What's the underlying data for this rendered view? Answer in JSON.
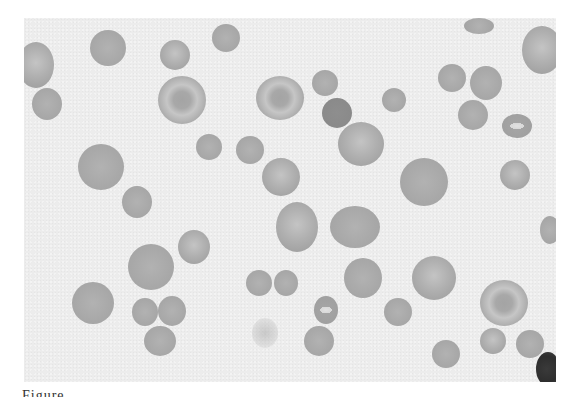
{
  "figure": {
    "type": "blood-smear-micrograph",
    "background_color": "#ececec",
    "cell_color": "#a9a9a9",
    "caption_fragment": "Figure"
  },
  "cells": [
    {
      "x": -6,
      "y": 24,
      "w": 36,
      "h": 46,
      "kind": "pale"
    },
    {
      "x": 8,
      "y": 70,
      "w": 30,
      "h": 32,
      "kind": "solid"
    },
    {
      "x": 66,
      "y": 12,
      "w": 36,
      "h": 36,
      "kind": "solid"
    },
    {
      "x": 136,
      "y": 22,
      "w": 30,
      "h": 30,
      "kind": "pale"
    },
    {
      "x": 188,
      "y": 6,
      "w": 28,
      "h": 28,
      "kind": "solid"
    },
    {
      "x": 134,
      "y": 58,
      "w": 48,
      "h": 48,
      "kind": "target"
    },
    {
      "x": 232,
      "y": 58,
      "w": 48,
      "h": 44,
      "kind": "target"
    },
    {
      "x": 288,
      "y": 52,
      "w": 26,
      "h": 26,
      "kind": "solid"
    },
    {
      "x": 298,
      "y": 80,
      "w": 30,
      "h": 30,
      "kind": "dark"
    },
    {
      "x": 358,
      "y": 70,
      "w": 24,
      "h": 24,
      "kind": "solid"
    },
    {
      "x": 314,
      "y": 104,
      "w": 46,
      "h": 44,
      "kind": "pale"
    },
    {
      "x": 440,
      "y": 0,
      "w": 30,
      "h": 16,
      "kind": "solid"
    },
    {
      "x": 498,
      "y": 8,
      "w": 40,
      "h": 48,
      "kind": "pale"
    },
    {
      "x": 414,
      "y": 46,
      "w": 28,
      "h": 28,
      "kind": "solid"
    },
    {
      "x": 446,
      "y": 48,
      "w": 32,
      "h": 34,
      "kind": "solid"
    },
    {
      "x": 434,
      "y": 82,
      "w": 30,
      "h": 30,
      "kind": "solid"
    },
    {
      "x": 478,
      "y": 96,
      "w": 30,
      "h": 24,
      "kind": "stomatocyte"
    },
    {
      "x": 172,
      "y": 116,
      "w": 26,
      "h": 26,
      "kind": "solid"
    },
    {
      "x": 212,
      "y": 118,
      "w": 28,
      "h": 28,
      "kind": "solid"
    },
    {
      "x": 54,
      "y": 126,
      "w": 46,
      "h": 46,
      "kind": "solid"
    },
    {
      "x": 238,
      "y": 140,
      "w": 38,
      "h": 38,
      "kind": "pale"
    },
    {
      "x": 376,
      "y": 140,
      "w": 48,
      "h": 48,
      "kind": "solid"
    },
    {
      "x": 476,
      "y": 142,
      "w": 30,
      "h": 30,
      "kind": "pale"
    },
    {
      "x": 98,
      "y": 168,
      "w": 30,
      "h": 32,
      "kind": "solid"
    },
    {
      "x": 252,
      "y": 184,
      "w": 42,
      "h": 50,
      "kind": "pale"
    },
    {
      "x": 306,
      "y": 188,
      "w": 50,
      "h": 42,
      "kind": "solid"
    },
    {
      "x": 516,
      "y": 198,
      "w": 20,
      "h": 28,
      "kind": "solid"
    },
    {
      "x": 154,
      "y": 212,
      "w": 32,
      "h": 34,
      "kind": "pale"
    },
    {
      "x": 104,
      "y": 226,
      "w": 46,
      "h": 46,
      "kind": "solid"
    },
    {
      "x": 320,
      "y": 240,
      "w": 38,
      "h": 40,
      "kind": "solid"
    },
    {
      "x": 388,
      "y": 238,
      "w": 44,
      "h": 44,
      "kind": "pale"
    },
    {
      "x": 222,
      "y": 252,
      "w": 26,
      "h": 26,
      "kind": "solid"
    },
    {
      "x": 250,
      "y": 252,
      "w": 24,
      "h": 26,
      "kind": "solid"
    },
    {
      "x": 48,
      "y": 264,
      "w": 42,
      "h": 42,
      "kind": "solid"
    },
    {
      "x": 456,
      "y": 262,
      "w": 48,
      "h": 46,
      "kind": "target"
    },
    {
      "x": 108,
      "y": 280,
      "w": 26,
      "h": 28,
      "kind": "solid"
    },
    {
      "x": 134,
      "y": 278,
      "w": 28,
      "h": 30,
      "kind": "solid"
    },
    {
      "x": 290,
      "y": 278,
      "w": 24,
      "h": 28,
      "kind": "stomatocyte"
    },
    {
      "x": 360,
      "y": 280,
      "w": 28,
      "h": 28,
      "kind": "solid"
    },
    {
      "x": 120,
      "y": 308,
      "w": 32,
      "h": 30,
      "kind": "solid"
    },
    {
      "x": 228,
      "y": 300,
      "w": 26,
      "h": 30,
      "kind": "ghost"
    },
    {
      "x": 280,
      "y": 308,
      "w": 30,
      "h": 30,
      "kind": "solid"
    },
    {
      "x": 456,
      "y": 310,
      "w": 26,
      "h": 26,
      "kind": "pale"
    },
    {
      "x": 492,
      "y": 312,
      "w": 28,
      "h": 28,
      "kind": "solid"
    },
    {
      "x": 408,
      "y": 322,
      "w": 28,
      "h": 28,
      "kind": "solid"
    },
    {
      "x": 512,
      "y": 334,
      "w": 24,
      "h": 34,
      "kind": "lymph"
    }
  ]
}
